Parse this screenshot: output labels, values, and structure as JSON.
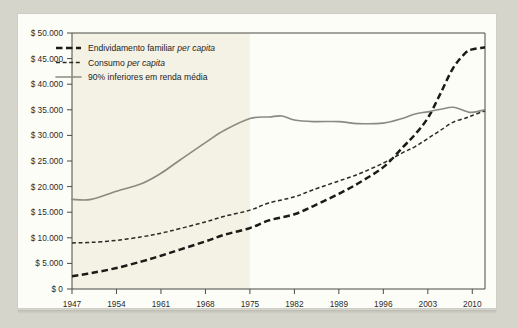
{
  "chart_data": {
    "type": "line",
    "title": "",
    "subtitle": "",
    "xlabel": "",
    "ylabel": "",
    "xlim": [
      1947,
      2012
    ],
    "ylim": [
      0,
      50000
    ],
    "grid": false,
    "legend_position": "top-left",
    "x_tick_labels": [
      "1947",
      "1954",
      "1961",
      "1968",
      "1975",
      "1982",
      "1989",
      "1996",
      "2003",
      "2010"
    ],
    "x_ticks": [
      1947,
      1954,
      1961,
      1968,
      1975,
      1982,
      1989,
      1996,
      2003,
      2010
    ],
    "y_tick_labels": [
      "$ 0",
      "$ 5.000",
      "$ 10.000",
      "$ 15.000",
      "$ 20.000",
      "$ 25.000",
      "$ 30.000",
      "$ 35.000",
      "$ 40.000",
      "$ 45.000",
      "$ 50.000"
    ],
    "y_ticks": [
      0,
      5000,
      10000,
      15000,
      20000,
      25000,
      30000,
      35000,
      40000,
      45000,
      50000
    ],
    "shaded_region": {
      "from": 1947,
      "to": 1975,
      "color": "#f4f2e5"
    },
    "series": [
      {
        "name": "Endividamento familiar per capita",
        "legend_prefix": "Endividamento familiar",
        "legend_italic": "per capita",
        "style": "dashed-thick",
        "color": "#1a1a17",
        "x": [
          1947,
          1950,
          1954,
          1958,
          1961,
          1964,
          1968,
          1971,
          1975,
          1978,
          1982,
          1985,
          1989,
          1992,
          1996,
          1999,
          2001,
          2003,
          2005,
          2007,
          2009,
          2010,
          2012
        ],
        "values": [
          2500,
          3100,
          4100,
          5400,
          6500,
          7700,
          9300,
          10600,
          11900,
          13400,
          14600,
          16200,
          18600,
          20600,
          23800,
          27600,
          30200,
          33400,
          38200,
          43200,
          46200,
          46800,
          47200
        ]
      },
      {
        "name": "Consumo per capita",
        "legend_prefix": "Consumo",
        "legend_italic": "per capita",
        "style": "dashed-thin",
        "color": "#2a2a26",
        "x": [
          1947,
          1950,
          1954,
          1958,
          1961,
          1964,
          1968,
          1971,
          1975,
          1978,
          1982,
          1985,
          1989,
          1992,
          1996,
          1999,
          2001,
          2003,
          2005,
          2007,
          2009,
          2010,
          2012
        ],
        "values": [
          9000,
          9100,
          9500,
          10200,
          10900,
          11800,
          13100,
          14200,
          15400,
          16800,
          18000,
          19400,
          21100,
          22400,
          24600,
          26600,
          27800,
          29400,
          31000,
          32600,
          33400,
          33900,
          34800
        ]
      },
      {
        "name": "90% inferiores em renda média",
        "legend_prefix": "90% inferiores em renda média",
        "legend_italic": "",
        "style": "solid",
        "color": "#8a8a80",
        "x": [
          1947,
          1950,
          1954,
          1958,
          1961,
          1964,
          1968,
          1971,
          1975,
          1978,
          1980,
          1982,
          1985,
          1989,
          1992,
          1996,
          1999,
          2001,
          2003,
          2005,
          2007,
          2009,
          2010,
          2012
        ],
        "values": [
          17500,
          17500,
          19100,
          20600,
          22600,
          25200,
          28600,
          31000,
          33300,
          33600,
          33800,
          33000,
          32700,
          32700,
          32300,
          32400,
          33300,
          34200,
          34600,
          35100,
          35500,
          34700,
          34500,
          35000
        ]
      }
    ]
  },
  "legend": {
    "items": [
      {
        "label_main": "Endividamento familiar ",
        "label_italic": "per capita",
        "swatch": "dashed-thick-swatch"
      },
      {
        "label_main": "Consumo ",
        "label_italic": "per capita",
        "swatch": "dashed-thin-swatch"
      },
      {
        "label_main": "90% inferiores em renda média",
        "label_italic": "",
        "swatch": "solid-line-swatch"
      }
    ]
  }
}
